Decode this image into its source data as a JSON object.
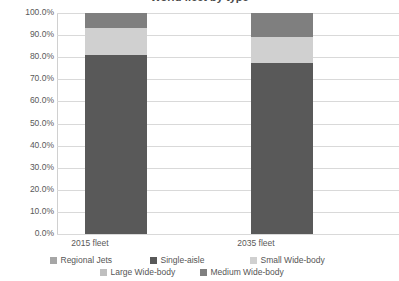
{
  "chart_data": {
    "type": "bar",
    "subtype": "stacked-100-percent",
    "title": "World fleet by type",
    "xlabel": "",
    "ylabel": "",
    "ylim": [
      0,
      100
    ],
    "ytick_labels": [
      "100.0%",
      "90.0%",
      "80.0%",
      "70.0%",
      "60.0%",
      "50.0%",
      "40.0%",
      "30.0%",
      "20.0%",
      "10.0%",
      "0.0%"
    ],
    "ytick_values": [
      100,
      90,
      80,
      70,
      60,
      50,
      40,
      30,
      20,
      10,
      0
    ],
    "grid": true,
    "legend_position": "bottom",
    "categories": [
      "2015 fleet",
      "2035 fleet"
    ],
    "series": [
      {
        "name": "Regional Jets",
        "color": "#a6a6a6",
        "values": [
          0.0,
          0.0
        ]
      },
      {
        "name": "Single-aisle",
        "color": "#595959",
        "values": [
          81.0,
          77.5
        ]
      },
      {
        "name": "Small Wide-body",
        "color": "#d0d0d0",
        "values": [
          12.0,
          11.5
        ]
      },
      {
        "name": "Large Wide-body",
        "color": "#bfbfbf",
        "values": [
          0.0,
          0.0
        ]
      },
      {
        "name": "Medium Wide-body",
        "color": "#7f7f7f",
        "values": [
          7.0,
          11.0
        ]
      }
    ]
  },
  "legend": {
    "rows": [
      [
        {
          "label": "Regional Jets",
          "color": "#a6a6a6"
        },
        {
          "label": "Single-aisle",
          "color": "#595959"
        },
        {
          "label": "Small Wide-body",
          "color": "#d0d0d0"
        }
      ],
      [
        {
          "label": "Large Wide-body",
          "color": "#bfbfbf"
        },
        {
          "label": "Medium Wide-body",
          "color": "#7f7f7f"
        }
      ]
    ]
  },
  "colors": {
    "gridline": "#d9d9d9",
    "text": "#595959",
    "background": "#ffffff"
  }
}
